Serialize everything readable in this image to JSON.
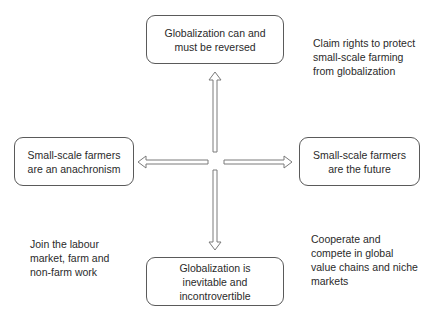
{
  "diagram": {
    "boxes": {
      "top": {
        "lines": [
          "Globalization can and",
          "must be reversed"
        ]
      },
      "left": {
        "lines": [
          "Small-scale farmers",
          "are an anachronism"
        ]
      },
      "right": {
        "lines": [
          "Small-scale farmers",
          "are the future"
        ]
      },
      "bottom": {
        "lines": [
          "Globalization is",
          "inevitable and",
          "incontrovertible"
        ]
      }
    },
    "notes": {
      "top_right": {
        "lines": [
          "Claim rights to protect",
          "small-scale farming",
          "from globalization"
        ]
      },
      "bottom_left": {
        "lines": [
          "Join the labour",
          "market, farm and",
          "non-farm work"
        ]
      },
      "bottom_right": {
        "lines": [
          "Cooperate and",
          "compete in global",
          "value chains and niche",
          "markets"
        ]
      }
    },
    "arrows": [
      {
        "direction": "up",
        "target": "top"
      },
      {
        "direction": "down",
        "target": "bottom"
      },
      {
        "direction": "left",
        "target": "left"
      },
      {
        "direction": "right",
        "target": "right"
      }
    ],
    "colors": {
      "stroke": "#5a5a5a",
      "text": "#2a2a2a",
      "background": "#ffffff"
    }
  }
}
